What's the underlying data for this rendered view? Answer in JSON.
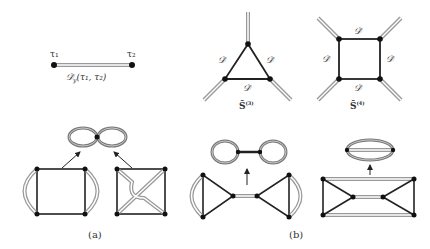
{
  "propagator": {
    "left_label": "τ₁",
    "right_label": "τ₂",
    "formula": "𝒟̄_y(τ₁, τ₂)",
    "formula_main": "𝒟̄",
    "formula_sub": "y",
    "formula_args": "(τ₁, τ₂)"
  },
  "vertex3": {
    "edge_labels": [
      "𝒟̄",
      "𝒟̄",
      "𝒟̄"
    ],
    "name_main": "S̄",
    "name_sup": "(3)"
  },
  "vertex4": {
    "edge_labels": [
      "𝒟̄",
      "𝒟̄",
      "𝒟̄",
      "𝒟̄"
    ],
    "name_main": "S̄",
    "name_sup": "(4)"
  },
  "panels": {
    "a_label": "(a)",
    "b_label": "(b)"
  },
  "colors": {
    "line": "#222222",
    "double_line": "#999999",
    "vertex": "#111111"
  }
}
